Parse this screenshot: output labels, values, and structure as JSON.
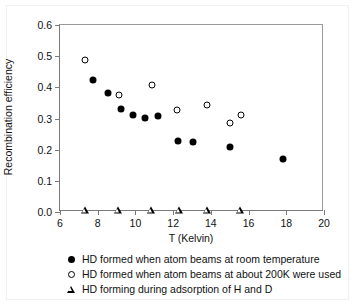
{
  "chart_data": {
    "type": "scatter",
    "title": "",
    "xlabel": "T (Kelvin)",
    "ylabel": "Recombination efficiency",
    "xlim": [
      6,
      20
    ],
    "ylim": [
      0.0,
      0.6
    ],
    "xticks": [
      "6",
      "8",
      "10",
      "12",
      "14",
      "16",
      "18",
      "20"
    ],
    "yticks": [
      "0.0",
      "0.1",
      "0.2",
      "0.3",
      "0.4",
      "0.5",
      "0.6"
    ],
    "xtick_values": [
      6,
      8,
      10,
      12,
      14,
      16,
      18,
      20
    ],
    "ytick_values": [
      0.0,
      0.1,
      0.2,
      0.3,
      0.4,
      0.5,
      0.6
    ],
    "grid": false,
    "legend_position": "below",
    "series": [
      {
        "name": "HD formed when atom beams at room temperature",
        "marker": "filled-circle",
        "color": "#000000",
        "points": [
          {
            "x": 7.75,
            "y": 0.422
          },
          {
            "x": 8.55,
            "y": 0.383
          },
          {
            "x": 9.25,
            "y": 0.332
          },
          {
            "x": 9.85,
            "y": 0.311
          },
          {
            "x": 10.5,
            "y": 0.303
          },
          {
            "x": 11.2,
            "y": 0.309
          },
          {
            "x": 12.25,
            "y": 0.228
          },
          {
            "x": 13.05,
            "y": 0.224
          },
          {
            "x": 15.0,
            "y": 0.207
          },
          {
            "x": 17.85,
            "y": 0.17
          }
        ]
      },
      {
        "name": "HD formed when atom beams at about 200K were used",
        "marker": "open-circle",
        "color": "#000000",
        "points": [
          {
            "x": 7.3,
            "y": 0.489
          },
          {
            "x": 9.15,
            "y": 0.376
          },
          {
            "x": 10.9,
            "y": 0.408
          },
          {
            "x": 12.2,
            "y": 0.328
          },
          {
            "x": 13.8,
            "y": 0.344
          },
          {
            "x": 15.0,
            "y": 0.286
          },
          {
            "x": 15.6,
            "y": 0.311
          }
        ]
      },
      {
        "name": "HD forming during adsorption of H and D",
        "marker": "open-triangle",
        "color": "#000000",
        "points": [
          {
            "x": 7.3,
            "y": 0.006
          },
          {
            "x": 9.05,
            "y": 0.006
          },
          {
            "x": 10.8,
            "y": 0.006
          },
          {
            "x": 12.3,
            "y": 0.006
          },
          {
            "x": 13.8,
            "y": 0.006
          },
          {
            "x": 15.55,
            "y": 0.006
          }
        ]
      }
    ]
  },
  "legend": [
    {
      "marker": "filled-circle",
      "label": "HD formed when atom beams at room temperature"
    },
    {
      "marker": "open-circle",
      "label": "HD formed when atom beams at about 200K were used"
    },
    {
      "marker": "open-triangle",
      "label": "HD forming during adsorption of H and D"
    }
  ],
  "colors": {
    "axis": "#7a7a7a",
    "marker": "#000000",
    "background": "#ffffff"
  }
}
